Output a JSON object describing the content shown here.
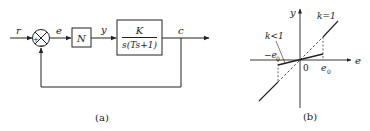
{
  "figure_a": {
    "caption": "(a)",
    "signals": {
      "input": "r",
      "error": "e",
      "nonlinear_output": "y",
      "output": "c"
    },
    "summing_junction": {
      "plus_sign": "+",
      "minus_sign": "−"
    },
    "blocks": {
      "nonlinear": "N",
      "plant_numerator": "K",
      "plant_denominator": "s(Ts+1)"
    }
  },
  "figure_b": {
    "caption": "(b)",
    "axes": {
      "x_label": "e",
      "y_label": "y",
      "origin": "0"
    },
    "ticks": {
      "pos": "e",
      "pos_sub": "0",
      "neg": "−e",
      "neg_sub": "0"
    },
    "curves": {
      "unity": "k=1",
      "reduced": "k<1"
    }
  },
  "colors": {
    "line": "#222222",
    "background": "#ffffff"
  }
}
